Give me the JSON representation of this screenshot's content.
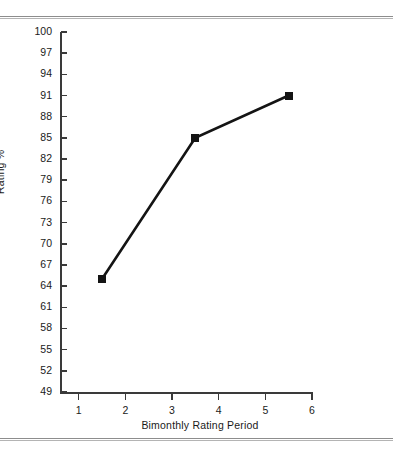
{
  "chart_data": {
    "type": "line",
    "title": "",
    "xlabel": "Bimonthly Rating Period",
    "ylabel": "Rating %",
    "x": [
      1.5,
      3.5,
      5.5
    ],
    "values": [
      65,
      85,
      91
    ],
    "series": [
      {
        "name": "Rating %",
        "x": [
          1.5,
          3.5,
          5.5
        ],
        "values": [
          65,
          85,
          91
        ]
      }
    ],
    "xlim": [
      0.6,
      6.6
    ],
    "ylim": [
      49,
      100
    ],
    "xticks": [
      1,
      2,
      3,
      4,
      5,
      6
    ],
    "xtick_labels": [
      "1",
      "2",
      "3",
      "4",
      "5",
      "6"
    ],
    "yticks": [
      49,
      52,
      55,
      58,
      61,
      64,
      67,
      70,
      73,
      76,
      79,
      82,
      85,
      88,
      91,
      94,
      97,
      100
    ],
    "ytick_labels": [
      "49",
      "52",
      "55",
      "58",
      "61",
      "64",
      "67",
      "70",
      "73",
      "76",
      "79",
      "82",
      "85",
      "88",
      "91",
      "94",
      "97",
      "100"
    ],
    "grid": false,
    "legend": "none",
    "marker": "filled-square",
    "line_color": "#141414",
    "marker_color": "#141414",
    "axis_color": "#3a3a3a"
  },
  "figure": {
    "rule_color": "#8d8d8d",
    "background": "#ffffff"
  }
}
